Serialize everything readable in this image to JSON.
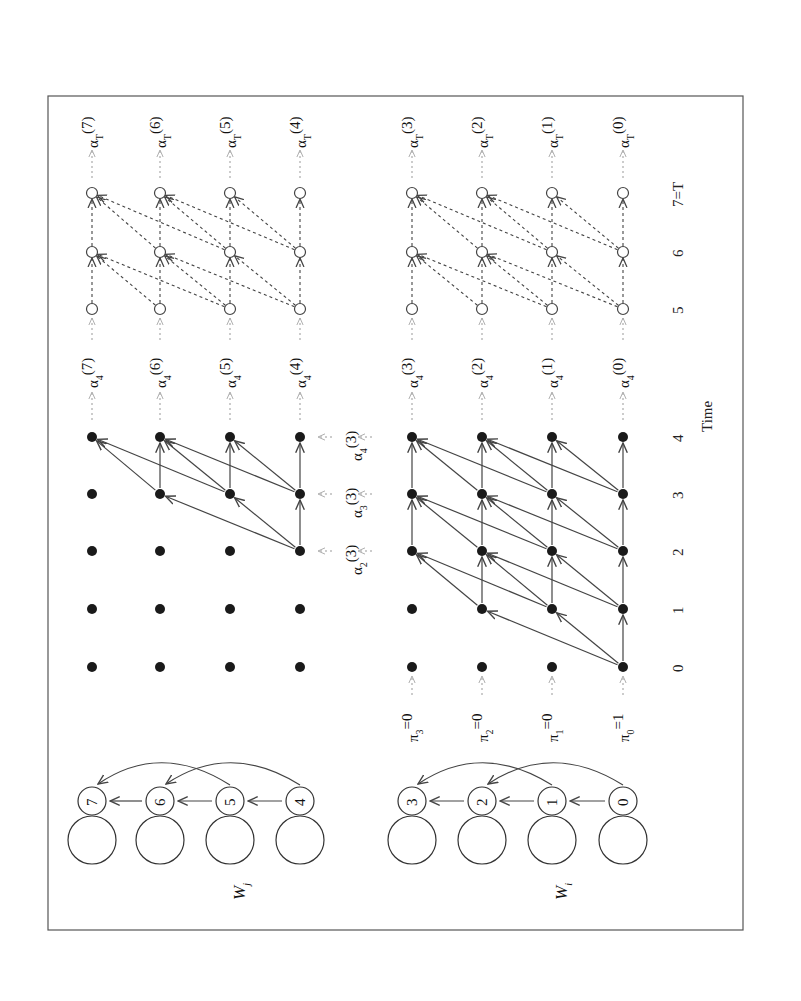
{
  "figure": {
    "orientation": "rotated 90 degrees counter-clockwise",
    "axis_label": "Time",
    "time_ticks": [
      "0",
      "1",
      "2",
      "3",
      "4",
      "5",
      "6",
      "7=T"
    ],
    "upper_panel": {
      "model_label": "W",
      "model_subscript": "j",
      "states": [
        "7",
        "6",
        "5",
        "4"
      ],
      "alpha4_labels": [
        {
          "base": "α",
          "sub": "4",
          "arg": "(7)"
        },
        {
          "base": "α",
          "sub": "4",
          "arg": "(6)"
        },
        {
          "base": "α",
          "sub": "4",
          "arg": "(5)"
        },
        {
          "base": "α",
          "sub": "4",
          "arg": "(4)"
        }
      ],
      "alphaT_labels": [
        {
          "base": "α",
          "sub": "T",
          "arg": "(7)"
        },
        {
          "base": "α",
          "sub": "T",
          "arg": "(6)"
        },
        {
          "base": "α",
          "sub": "T",
          "arg": "(5)"
        },
        {
          "base": "α",
          "sub": "T",
          "arg": "(4)"
        }
      ]
    },
    "middle_labels": [
      {
        "base": "α",
        "sub": "2",
        "arg": "(3)"
      },
      {
        "base": "α",
        "sub": "3",
        "arg": "(3)"
      },
      {
        "base": "α",
        "sub": "4",
        "arg": "(3)"
      }
    ],
    "lower_panel": {
      "model_label": "W",
      "model_subscript": "i",
      "states": [
        "3",
        "2",
        "1",
        "0"
      ],
      "initial_probs": [
        {
          "base": "π",
          "sub": "3",
          "val": "=0"
        },
        {
          "base": "π",
          "sub": "2",
          "val": "=0"
        },
        {
          "base": "π",
          "sub": "1",
          "val": "=0"
        },
        {
          "base": "π",
          "sub": "0",
          "val": "=1"
        }
      ],
      "alpha4_labels": [
        {
          "base": "α",
          "sub": "4",
          "arg": "(3)"
        },
        {
          "base": "α",
          "sub": "4",
          "arg": "(2)"
        },
        {
          "base": "α",
          "sub": "4",
          "arg": "(1)"
        },
        {
          "base": "α",
          "sub": "4",
          "arg": "(0)"
        }
      ],
      "alphaT_labels": [
        {
          "base": "α",
          "sub": "T",
          "arg": "(3)"
        },
        {
          "base": "α",
          "sub": "T",
          "arg": "(2)"
        },
        {
          "base": "α",
          "sub": "T",
          "arg": "(1)"
        },
        {
          "base": "α",
          "sub": "T",
          "arg": "(0)"
        }
      ]
    }
  }
}
